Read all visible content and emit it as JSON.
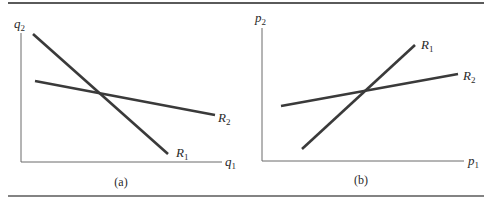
{
  "figure": {
    "panels": [
      {
        "id": "a",
        "caption": "(a)",
        "x_axis_label": "q",
        "x_axis_sub": "1",
        "y_axis_label": "q",
        "y_axis_sub": "2",
        "lines": [
          {
            "name": "R",
            "sub": "1",
            "from": [
              33,
              34
            ],
            "to": [
              168,
              154
            ],
            "label_pos": [
              176,
              157
            ]
          },
          {
            "name": "R",
            "sub": "2",
            "from": [
              35,
              81
            ],
            "to": [
              215,
              115
            ],
            "label_pos": [
              218,
              122
            ]
          }
        ]
      },
      {
        "id": "b",
        "caption": "(b)",
        "x_axis_label": "p",
        "x_axis_sub": "1",
        "y_axis_label": "p",
        "y_axis_sub": "2",
        "lines": [
          {
            "name": "R",
            "sub": "1",
            "from": [
              302,
              149
            ],
            "to": [
              415,
              45
            ],
            "label_pos": [
              421,
              49
            ]
          },
          {
            "name": "R",
            "sub": "2",
            "from": [
              281,
              106
            ],
            "to": [
              458,
              74
            ],
            "label_pos": [
              463,
              80
            ]
          }
        ]
      }
    ]
  },
  "colors": {
    "line": "#3a3a3a",
    "axis": "#6a6a6a",
    "rule": "#5a5a5a",
    "text": "#2a2a2a"
  }
}
